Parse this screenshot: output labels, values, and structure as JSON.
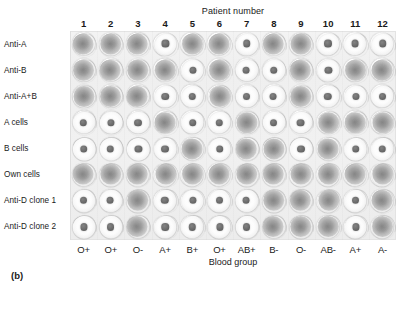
{
  "figure": {
    "panel_letter": "(b)",
    "top_axis_title": "Patient number",
    "bottom_axis_title": "Blood group"
  },
  "columns": {
    "numbers": [
      "1",
      "2",
      "3",
      "4",
      "5",
      "6",
      "7",
      "8",
      "9",
      "10",
      "11",
      "12"
    ],
    "blood_groups": [
      "O+",
      "O+",
      "O-",
      "A+",
      "B+",
      "O+",
      "AB+",
      "B-",
      "O-",
      "AB-",
      "A+",
      "A-"
    ]
  },
  "rows": [
    {
      "label": "Anti-A"
    },
    {
      "label": "Anti-B"
    },
    {
      "label": "Anti-A+B"
    },
    {
      "label": "A cells"
    },
    {
      "label": "B cells"
    },
    {
      "label": "Own cells"
    },
    {
      "label": "Anti-D clone 1"
    },
    {
      "label": "Anti-D clone 2"
    }
  ],
  "legend": {
    "agglutinated": "diffuse carpet of cells filling the well (positive reaction)",
    "button": "compact cell button at well centre (negative reaction)"
  },
  "colors": {
    "plate": "#f1f1f1",
    "agglutinated_cells": "#6c6c6c",
    "button_cells": "#6f6f6f",
    "text": "#1a1a1a"
  },
  "chart_data": {
    "type": "heatmap",
    "xlabel": "Patient number",
    "ylabel": "Blood group",
    "x": [
      "1",
      "2",
      "3",
      "4",
      "5",
      "6",
      "7",
      "8",
      "9",
      "10",
      "11",
      "12"
    ],
    "x_secondary_labels": [
      "O+",
      "O+",
      "O-",
      "A+",
      "B+",
      "O+",
      "AB+",
      "B-",
      "O-",
      "AB-",
      "A+",
      "A-"
    ],
    "y": [
      "Anti-A",
      "Anti-B",
      "Anti-A+B",
      "A cells",
      "B cells",
      "Own cells",
      "Anti-D clone 1",
      "Anti-D clone 2"
    ],
    "value_encoding": {
      "1": "agglutinated",
      "0": "button"
    },
    "series": [
      {
        "name": "Anti-A",
        "values": [
          1,
          1,
          1,
          0,
          1,
          1,
          0,
          1,
          1,
          0,
          0,
          0
        ]
      },
      {
        "name": "Anti-B",
        "values": [
          1,
          1,
          1,
          1,
          0,
          1,
          0,
          0,
          1,
          0,
          1,
          1
        ]
      },
      {
        "name": "Anti-A+B",
        "values": [
          1,
          1,
          1,
          0,
          0,
          1,
          0,
          0,
          1,
          0,
          0,
          0
        ]
      },
      {
        "name": "A cells",
        "values": [
          0,
          0,
          0,
          1,
          0,
          0,
          1,
          0,
          0,
          1,
          1,
          1
        ]
      },
      {
        "name": "B cells",
        "values": [
          0,
          0,
          0,
          0,
          1,
          0,
          1,
          1,
          0,
          1,
          0,
          0
        ]
      },
      {
        "name": "Own cells",
        "values": [
          1,
          1,
          1,
          1,
          1,
          1,
          1,
          1,
          1,
          1,
          1,
          1
        ]
      },
      {
        "name": "Anti-D clone 1",
        "values": [
          0,
          0,
          1,
          0,
          0,
          0,
          0,
          1,
          1,
          1,
          0,
          1
        ]
      },
      {
        "name": "Anti-D clone 2",
        "values": [
          0,
          0,
          1,
          0,
          0,
          0,
          0,
          1,
          1,
          1,
          0,
          1
        ]
      }
    ],
    "grid": false,
    "legend_position": "none"
  }
}
